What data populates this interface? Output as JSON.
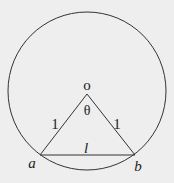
{
  "diagram": {
    "background": "#eeeeee",
    "stroke": "#333333",
    "circle": {
      "cx": 87,
      "cy": 91,
      "r": 79
    },
    "center": {
      "x": 87,
      "y": 94,
      "label": "o"
    },
    "point_a": {
      "x": 40,
      "y": 155,
      "label": "a"
    },
    "point_b": {
      "x": 135,
      "y": 155,
      "label": "b"
    },
    "labels": {
      "angle": "θ",
      "left_side": "1",
      "right_side": "1",
      "chord": "l"
    }
  }
}
